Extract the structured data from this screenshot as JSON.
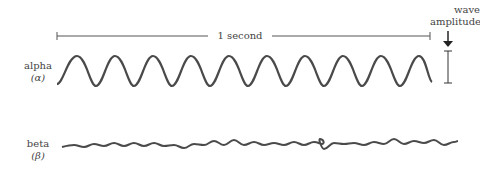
{
  "timebar": {
    "label": "1 second"
  },
  "amplitude": {
    "label_line1": "wave",
    "label_line2": "amplitude"
  },
  "waves": [
    {
      "name": "alpha",
      "symbol": "(α)",
      "cycles": 10
    },
    {
      "name": "beta",
      "symbol": "(β)"
    }
  ],
  "colors": {
    "stroke": "#4a4a4a",
    "text": "#444444"
  }
}
